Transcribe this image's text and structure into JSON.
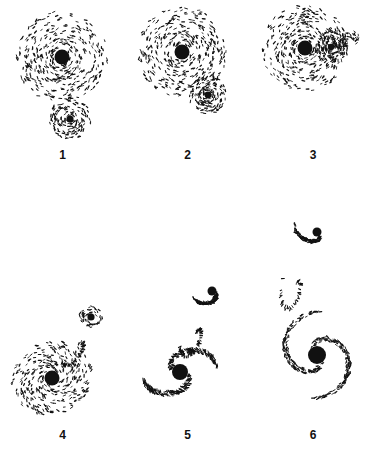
{
  "figure": {
    "background_color": "#ffffff",
    "ink_color": "#111111",
    "caption_fragment": "",
    "panels": [
      {
        "label": "1",
        "name": "panel-1",
        "stage": "pre-encounter",
        "description": "Large face-on disk galaxy with small separate companion disk below",
        "objects": [
          {
            "role": "primary-disk",
            "cx": 62,
            "cy": 57,
            "radius": 46,
            "nucleus_r": 7.5,
            "particles": 430,
            "arms": 0,
            "pitch": 0.62,
            "ellipticity": 1.0,
            "tilt": 0
          },
          {
            "role": "companion-disk",
            "cx": 70,
            "cy": 119,
            "radius": 21,
            "nucleus_r": 3.6,
            "particles": 150,
            "arms": 0,
            "pitch": 0.55,
            "ellipticity": 1.0,
            "tilt": 0
          }
        ]
      },
      {
        "label": "2",
        "name": "panel-2",
        "stage": "first-approach",
        "description": "Companion has moved to lower-right edge of the primary disk, disk outline slightly distorted",
        "objects": [
          {
            "role": "primary-disk",
            "cx": 182,
            "cy": 52,
            "radius": 45,
            "nucleus_r": 7.5,
            "particles": 420,
            "arms": 0,
            "pitch": 0.6,
            "ellipticity": 1.0,
            "tilt": 0
          },
          {
            "role": "companion-disk",
            "cx": 208,
            "cy": 95,
            "radius": 19,
            "nucleus_r": 3.4,
            "particles": 150,
            "arms": 0,
            "pitch": 0.5,
            "ellipticity": 1.0,
            "tilt": 0
          }
        ]
      },
      {
        "label": "3",
        "name": "panel-3",
        "stage": "contact",
        "description": "Companion embedded in the right-hand outskirts of the primary disk, debris spur extends to the right",
        "objects": [
          {
            "role": "primary-disk",
            "cx": 305,
            "cy": 48,
            "radius": 43,
            "nucleus_r": 7.5,
            "particles": 410,
            "arms": 0,
            "pitch": 0.6,
            "ellipticity": 1.0,
            "tilt": 0
          },
          {
            "role": "companion-disk",
            "cx": 331,
            "cy": 47,
            "radius": 16,
            "nucleus_r": 3.2,
            "particles": 120,
            "arms": 0,
            "pitch": 0.45,
            "ellipticity": 1.0,
            "tilt": 0
          },
          {
            "role": "debris-spur",
            "cx": 348,
            "cy": 40,
            "radius": 14,
            "nucleus_r": 0,
            "particles": 45,
            "arms": 0,
            "pitch": 0.4,
            "ellipticity": 0.55,
            "tilt": -20
          }
        ]
      },
      {
        "label": "4",
        "name": "panel-4",
        "stage": "post-passage",
        "description": "Companion pulled up and to the right forming a ring/loop, primary disk elongated with a tidal bridge",
        "objects": [
          {
            "role": "primary-disk",
            "cx": 52,
            "cy": 378,
            "radius": 41,
            "nucleus_r": 7.5,
            "particles": 370,
            "arms": 0,
            "pitch": 0.65,
            "ellipticity": 0.88,
            "tilt": -25
          },
          {
            "role": "companion-ring",
            "cx": 91,
            "cy": 317,
            "radius": 12,
            "nucleus_r": 3.6,
            "particles": 70,
            "arms": 0,
            "pitch": 0.3,
            "ellipticity": 0.9,
            "tilt": 0
          },
          {
            "role": "tidal-bridge",
            "cx": 78,
            "cy": 345,
            "radius": 26,
            "nucleus_r": 0,
            "particles": 60,
            "arms": 1,
            "pitch": 0.9,
            "ellipticity": 0.5,
            "tilt": -60
          }
        ]
      },
      {
        "label": "5",
        "name": "panel-5",
        "stage": "tidal-tail",
        "description": "Companion separated above; both systems linked by a long sweeping tidal tail curving to lower-left",
        "objects": [
          {
            "role": "primary-disk",
            "cx": 180,
            "cy": 372,
            "radius": 38,
            "nucleus_r": 8.0,
            "particles": 330,
            "arms": 2,
            "pitch": 0.8,
            "ellipticity": 0.85,
            "tilt": -15
          },
          {
            "role": "companion-disk",
            "cx": 212,
            "cy": 291,
            "radius": 21,
            "nucleus_r": 4.5,
            "particles": 130,
            "arms": 1,
            "pitch": 0.6,
            "ellipticity": 0.85,
            "tilt": 10
          },
          {
            "role": "tidal-bridge",
            "cx": 196,
            "cy": 333,
            "radius": 30,
            "nucleus_r": 0,
            "particles": 70,
            "arms": 1,
            "pitch": 1.0,
            "ellipticity": 0.45,
            "tilt": -70
          }
        ]
      },
      {
        "label": "6",
        "name": "panel-6",
        "stage": "late-stage-spiral",
        "description": "Primary relaxed into a two-armed spiral; companion far above as a loose disrupted cluster, scattered debris between",
        "objects": [
          {
            "role": "primary-spiral",
            "cx": 317,
            "cy": 355,
            "radius": 46,
            "nucleus_r": 9.0,
            "particles": 340,
            "arms": 2,
            "pitch": 1.15,
            "ellipticity": 0.95,
            "tilt": 10
          },
          {
            "role": "companion-cluster",
            "cx": 317,
            "cy": 232,
            "radius": 24,
            "nucleus_r": 4.5,
            "particles": 120,
            "arms": 1,
            "pitch": 0.7,
            "ellipticity": 0.8,
            "tilt": 30
          },
          {
            "role": "scattered-debris",
            "cx": 296,
            "cy": 285,
            "radius": 36,
            "nucleus_r": 0,
            "particles": 40,
            "arms": 1,
            "pitch": 1.2,
            "ellipticity": 0.4,
            "tilt": -75
          }
        ]
      }
    ]
  }
}
